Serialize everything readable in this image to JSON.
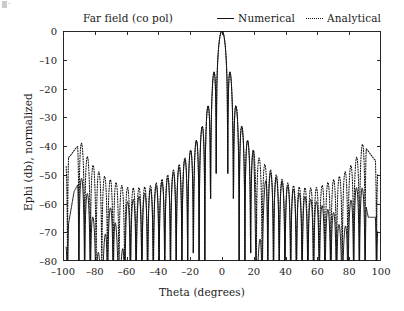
{
  "figure": {
    "title": "Far field (co pol)",
    "background_color": "#ffffff",
    "axis_color": "#111111"
  },
  "legend": {
    "position": "top-right",
    "entries": [
      {
        "label": "Numerical",
        "style": "solid",
        "icon": "solid-line-icon",
        "color": "#111111"
      },
      {
        "label": "Analytical",
        "style": "dotted",
        "icon": "dotted-line-icon",
        "color": "#111111"
      }
    ]
  },
  "axes": {
    "x": {
      "label": "Theta (degrees)",
      "min": -100,
      "max": 100,
      "ticks": [
        -100,
        -80,
        -60,
        -40,
        -20,
        0,
        20,
        40,
        60,
        80,
        100
      ],
      "tick_labels": [
        "–100",
        "–80",
        "–60",
        "–40",
        "–20",
        "0",
        "20",
        "40",
        "60",
        "80",
        "100"
      ]
    },
    "y": {
      "label": "Ephi (db), normalized",
      "min": -80,
      "max": 0,
      "ticks": [
        0,
        -10,
        -20,
        -30,
        -40,
        -50,
        -60,
        -70,
        -80
      ],
      "tick_labels": [
        "0",
        "–10",
        "–20",
        "–30",
        "–40",
        "–50",
        "–60",
        "–70",
        "–80"
      ]
    },
    "grid": false,
    "tick_direction": "in"
  },
  "chart_data": {
    "type": "line",
    "title": "Far field (co pol)",
    "xlabel": "Theta (degrees)",
    "ylabel": "Ephi (db), normalized",
    "xlim": [
      -100,
      100
    ],
    "ylim": [
      -80,
      0
    ],
    "grid": false,
    "legend_position": "top-right",
    "series": [
      {
        "name": "Numerical",
        "style": "solid",
        "color": "#111111",
        "model": {
          "kind": "array-pattern",
          "peak_db": 0,
          "peak_theta_deg": 0,
          "null_spacing_deg": 3.6,
          "envelope_rolloff_db_per_deg": 0.42,
          "first_sidelobe_db": -13.2,
          "edge_floor_db": -73,
          "edge_taper": "strong"
        },
        "landmark_points": [
          {
            "theta": -98,
            "db": -73
          },
          {
            "theta": -93,
            "db": -57
          },
          {
            "theta": -88,
            "db": -52
          },
          {
            "theta": -84,
            "db": -51
          },
          {
            "theta": -80,
            "db": -57
          },
          {
            "theta": -76,
            "db": -70
          },
          {
            "theta": -72,
            "db": -47
          },
          {
            "theta": -68,
            "db": -43
          },
          {
            "theta": -64,
            "db": -65
          },
          {
            "theta": -60,
            "db": -40
          },
          {
            "theta": -52,
            "db": -37
          },
          {
            "theta": -44,
            "db": -34
          },
          {
            "theta": -36,
            "db": -32
          },
          {
            "theta": -28,
            "db": -30
          },
          {
            "theta": -20,
            "db": -27
          },
          {
            "theta": -14,
            "db": -25
          },
          {
            "theta": -9,
            "db": -21
          },
          {
            "theta": -6,
            "db": -17
          },
          {
            "theta": -3.6,
            "db": -13
          },
          {
            "theta": 0,
            "db": 0
          },
          {
            "theta": 3.6,
            "db": -13
          },
          {
            "theta": 6,
            "db": -17
          },
          {
            "theta": 9,
            "db": -21
          },
          {
            "theta": 14,
            "db": -25
          },
          {
            "theta": 20,
            "db": -27
          },
          {
            "theta": 22,
            "db": -66
          },
          {
            "theta": 28,
            "db": -30
          },
          {
            "theta": 36,
            "db": -32
          },
          {
            "theta": 44,
            "db": -34
          },
          {
            "theta": 52,
            "db": -37
          },
          {
            "theta": 60,
            "db": -40
          },
          {
            "theta": 66,
            "db": -44
          },
          {
            "theta": 72,
            "db": -48
          },
          {
            "theta": 76,
            "db": -59
          },
          {
            "theta": 80,
            "db": -50
          },
          {
            "theta": 84,
            "db": -48
          },
          {
            "theta": 88,
            "db": -55
          },
          {
            "theta": 92,
            "db": -66
          }
        ]
      },
      {
        "name": "Analytical",
        "style": "dotted",
        "color": "#111111",
        "model": {
          "kind": "array-pattern",
          "peak_db": 0,
          "peak_theta_deg": 0,
          "null_spacing_deg": 3.6,
          "envelope_rolloff_db_per_deg": 0.33,
          "first_sidelobe_db": -13.2,
          "edge_floor_db": -48,
          "edge_taper": "mild"
        },
        "landmark_points": [
          {
            "theta": -96,
            "db": -45
          },
          {
            "theta": -92,
            "db": -42
          },
          {
            "theta": -88,
            "db": -40
          },
          {
            "theta": -84,
            "db": -38
          },
          {
            "theta": -80,
            "db": -37
          },
          {
            "theta": -74,
            "db": -36
          },
          {
            "theta": -68,
            "db": -35
          },
          {
            "theta": -60,
            "db": -35
          },
          {
            "theta": -52,
            "db": -34
          },
          {
            "theta": -44,
            "db": -33
          },
          {
            "theta": -36,
            "db": -31
          },
          {
            "theta": -28,
            "db": -29
          },
          {
            "theta": -20,
            "db": -27
          },
          {
            "theta": -14,
            "db": -25
          },
          {
            "theta": -9,
            "db": -21
          },
          {
            "theta": -6,
            "db": -17
          },
          {
            "theta": -3.6,
            "db": -13
          },
          {
            "theta": 0,
            "db": 0
          },
          {
            "theta": 3.6,
            "db": -13
          },
          {
            "theta": 6,
            "db": -17
          },
          {
            "theta": 9,
            "db": -21
          },
          {
            "theta": 14,
            "db": -25
          },
          {
            "theta": 20,
            "db": -27
          },
          {
            "theta": 28,
            "db": -29
          },
          {
            "theta": 36,
            "db": -31
          },
          {
            "theta": 44,
            "db": -33
          },
          {
            "theta": 52,
            "db": -34
          },
          {
            "theta": 60,
            "db": -35
          },
          {
            "theta": 68,
            "db": -35
          },
          {
            "theta": 74,
            "db": -36
          },
          {
            "theta": 80,
            "db": -37
          },
          {
            "theta": 86,
            "db": -39
          },
          {
            "theta": 92,
            "db": -43
          },
          {
            "theta": 96,
            "db": -46
          }
        ]
      }
    ]
  }
}
